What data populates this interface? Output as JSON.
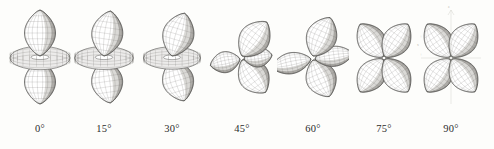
{
  "figure": {
    "background_color": "#fdfdfb",
    "ink_color": "#3a3a38",
    "mesh_color": "#55534e",
    "shade_dark": "#6e6b66",
    "shade_mid": "#a7a49e",
    "shade_light": "#e9e7e2",
    "annotation_color": "#b9b6ae",
    "label_color": "#2b2b2b"
  },
  "panels": [
    {
      "id": "orbital-0",
      "angle_label": "0°",
      "angle_value": 0,
      "shape": "dz2",
      "description": "two vertical lobes with horizontal torus ring",
      "center_x": 40,
      "lobe_tilt_deg": 0,
      "torus_split": 0
    },
    {
      "id": "orbital-15",
      "angle_label": "15°",
      "angle_value": 15,
      "shape": "dz2-tilted",
      "description": "vertical lobes tilted, torus ring distorting",
      "center_x": 104,
      "lobe_tilt_deg": 15,
      "torus_split": 0.15
    },
    {
      "id": "orbital-30",
      "angle_label": "30°",
      "angle_value": 30,
      "shape": "dz2-tilted",
      "description": "lobes tilted further, torus beginning to pinch",
      "center_x": 172,
      "lobe_tilt_deg": 30,
      "torus_split": 0.35
    },
    {
      "id": "orbital-45",
      "angle_label": "45°",
      "angle_value": 45,
      "shape": "transition",
      "description": "torus splitting into lobes, four-lobe clover emerging",
      "center_x": 242,
      "lobe_tilt_deg": 45,
      "torus_split": 0.6
    },
    {
      "id": "orbital-60",
      "angle_label": "60°",
      "angle_value": 60,
      "shape": "clover",
      "description": "four distinct lobes in clover arrangement",
      "center_x": 313,
      "lobe_tilt_deg": 60,
      "torus_split": 0.82
    },
    {
      "id": "orbital-75",
      "angle_label": "75°",
      "angle_value": 75,
      "shape": "clover",
      "description": "four-lobe clover, lobes more symmetric",
      "center_x": 384,
      "lobe_tilt_deg": 75,
      "torus_split": 0.94
    },
    {
      "id": "orbital-90",
      "angle_label": "90°",
      "angle_value": 90,
      "shape": "dx2-y2",
      "description": "symmetric four-lobe clover with faint axis lines",
      "center_x": 451,
      "lobe_tilt_deg": 90,
      "torus_split": 1,
      "has_axes": true,
      "axis_annotations": [
        {
          "text": "z",
          "x": 33,
          "y": 6
        },
        {
          "text": "y",
          "x": 60,
          "y": 44
        },
        {
          "text": "x",
          "x": 2,
          "y": 44
        },
        {
          "text": "+",
          "x": 5,
          "y": 36
        },
        {
          "text": "+",
          "x": 5,
          "y": 54
        },
        {
          "text": "−",
          "x": 55,
          "y": 36
        },
        {
          "text": "−",
          "x": 30,
          "y": 80
        }
      ]
    }
  ]
}
